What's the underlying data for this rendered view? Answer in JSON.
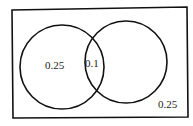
{
  "diagram": {
    "type": "venn",
    "sets": 2,
    "regions": {
      "a_only": "0.25",
      "intersection": "0.1",
      "b_only": "",
      "outside": "0.25"
    },
    "stroke_color": "#111111",
    "background": "#ffffff"
  }
}
